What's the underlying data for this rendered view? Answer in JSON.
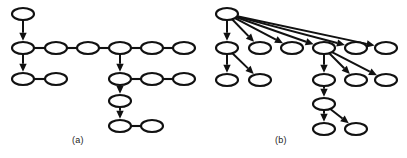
{
  "figure": {
    "background_color": "#ffffff",
    "stroke_color": "#111111",
    "node_fill_color": "#ffffff",
    "width": 407,
    "height": 158,
    "caption_a": "(a)",
    "caption_b": "(b)",
    "panels": [
      {
        "id": "panel-a",
        "label": "(a)",
        "description": "chain-structured dependency tree",
        "origin_x": 0,
        "node_rx": 11,
        "node_ry": 6,
        "nodes": [
          {
            "id": "a1",
            "cx": 23,
            "cy": 14
          },
          {
            "id": "a2",
            "cx": 23,
            "cy": 48
          },
          {
            "id": "a3",
            "cx": 23,
            "cy": 79
          },
          {
            "id": "a4",
            "cx": 56,
            "cy": 79
          },
          {
            "id": "a5",
            "cx": 56,
            "cy": 48
          },
          {
            "id": "a6",
            "cx": 88,
            "cy": 48
          },
          {
            "id": "a7",
            "cx": 120,
            "cy": 48
          },
          {
            "id": "a8",
            "cx": 152,
            "cy": 48
          },
          {
            "id": "a9",
            "cx": 184,
            "cy": 48
          },
          {
            "id": "a10",
            "cx": 120,
            "cy": 79
          },
          {
            "id": "a11",
            "cx": 152,
            "cy": 79
          },
          {
            "id": "a12",
            "cx": 184,
            "cy": 79
          },
          {
            "id": "a13",
            "cx": 120,
            "cy": 101
          },
          {
            "id": "a14",
            "cx": 120,
            "cy": 126
          },
          {
            "id": "a15",
            "cx": 152,
            "cy": 126
          }
        ],
        "plain_edges": [
          {
            "from": "a3",
            "to": "a4"
          },
          {
            "from": "a2",
            "to": "a5"
          },
          {
            "from": "a5",
            "to": "a6"
          },
          {
            "from": "a6",
            "to": "a7"
          },
          {
            "from": "a7",
            "to": "a8"
          },
          {
            "from": "a8",
            "to": "a9"
          },
          {
            "from": "a10",
            "to": "a11"
          },
          {
            "from": "a11",
            "to": "a12"
          },
          {
            "from": "a14",
            "to": "a15"
          }
        ],
        "arrow_edges": [
          {
            "from": "a1",
            "to": "a2"
          },
          {
            "from": "a2",
            "to": "a3"
          },
          {
            "from": "a7",
            "to": "a10"
          },
          {
            "from": "a10",
            "to": "a13"
          },
          {
            "from": "a13",
            "to": "a14"
          }
        ]
      },
      {
        "id": "panel-b",
        "label": "(b)",
        "description": "star-shaped dependency tree with wide fan-out from the root",
        "origin_x": 203,
        "node_rx": 11,
        "node_ry": 6,
        "nodes": [
          {
            "id": "b1",
            "cx": 24,
            "cy": 14
          },
          {
            "id": "b2",
            "cx": 24,
            "cy": 48
          },
          {
            "id": "b3",
            "cx": 57,
            "cy": 48
          },
          {
            "id": "b4",
            "cx": 89,
            "cy": 48
          },
          {
            "id": "b5",
            "cx": 121,
            "cy": 48
          },
          {
            "id": "b6",
            "cx": 153,
            "cy": 48
          },
          {
            "id": "b7",
            "cx": 183,
            "cy": 48
          },
          {
            "id": "b8",
            "cx": 24,
            "cy": 80
          },
          {
            "id": "b9",
            "cx": 57,
            "cy": 80
          },
          {
            "id": "b10",
            "cx": 121,
            "cy": 80
          },
          {
            "id": "b11",
            "cx": 153,
            "cy": 80
          },
          {
            "id": "b12",
            "cx": 183,
            "cy": 80
          },
          {
            "id": "b13",
            "cx": 121,
            "cy": 104
          },
          {
            "id": "b14",
            "cx": 121,
            "cy": 129
          },
          {
            "id": "b15",
            "cx": 153,
            "cy": 129
          }
        ],
        "plain_edges": [],
        "arrow_edges": [
          {
            "from": "b1",
            "to": "b2"
          },
          {
            "from": "b1",
            "to": "b3"
          },
          {
            "from": "b1",
            "to": "b4"
          },
          {
            "from": "b1",
            "to": "b5"
          },
          {
            "from": "b1",
            "to": "b6"
          },
          {
            "from": "b1",
            "to": "b7"
          },
          {
            "from": "b2",
            "to": "b8"
          },
          {
            "from": "b2",
            "to": "b9"
          },
          {
            "from": "b5",
            "to": "b10"
          },
          {
            "from": "b5",
            "to": "b11"
          },
          {
            "from": "b5",
            "to": "b12"
          },
          {
            "from": "b10",
            "to": "b13"
          },
          {
            "from": "b13",
            "to": "b14"
          },
          {
            "from": "b13",
            "to": "b15"
          }
        ]
      }
    ]
  }
}
